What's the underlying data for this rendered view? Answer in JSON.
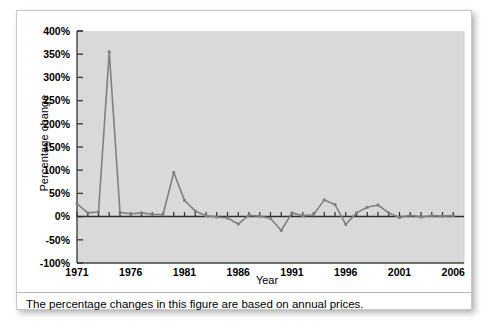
{
  "figure": {
    "caption": "The percentage changes in this figure are based on annual prices.",
    "background_color": "#ffffff",
    "plot_background_color": "#d9d9d9",
    "line_color": "#808080",
    "axis_color": "#404040"
  },
  "chart_data": {
    "type": "line",
    "title": "",
    "subtitle": "",
    "xlabel": "Year",
    "ylabel": "Percentage change",
    "xlim": [
      1971,
      2007
    ],
    "ylim": [
      -100,
      400
    ],
    "grid": false,
    "legend": "none",
    "y_ticks": [
      -100,
      -50,
      0,
      50,
      100,
      150,
      200,
      250,
      300,
      350,
      400
    ],
    "y_tick_labels": [
      "-100%",
      "-50%",
      "0%",
      "50%",
      "100%",
      "150%",
      "200%",
      "250%",
      "300%",
      "350%",
      "400%"
    ],
    "x_ticks": [
      1971,
      1972,
      1973,
      1974,
      1975,
      1976,
      1977,
      1978,
      1979,
      1980,
      1981,
      1982,
      1983,
      1984,
      1985,
      1986,
      1987,
      1988,
      1989,
      1990,
      1991,
      1992,
      1993,
      1994,
      1995,
      1996,
      1997,
      1998,
      1999,
      2000,
      2001,
      2002,
      2003,
      2004,
      2005,
      2006
    ],
    "x_tick_labels_shown": [
      "1971",
      "1976",
      "1981",
      "1986",
      "1991",
      "1996",
      "2001",
      "2006"
    ],
    "x_tick_labels_shown_values": [
      1971,
      1976,
      1981,
      1986,
      1991,
      1996,
      2001,
      2006
    ],
    "series": [
      {
        "name": "Percentage change",
        "x": [
          1971,
          1972,
          1973,
          1974,
          1975,
          1976,
          1977,
          1978,
          1979,
          1980,
          1981,
          1982,
          1983,
          1984,
          1985,
          1986,
          1987,
          1988,
          1989,
          1990,
          1991,
          1992,
          1993,
          1994,
          1995,
          1996,
          1997,
          1998,
          1999,
          2000,
          2001,
          2002,
          2003,
          2004,
          2005,
          2006
        ],
        "values": [
          28,
          8,
          10,
          355,
          9,
          6,
          8,
          5,
          4,
          95,
          35,
          12,
          2,
          -1,
          -3,
          -16,
          3,
          1,
          -4,
          -30,
          8,
          2,
          4,
          36,
          26,
          -17,
          8,
          20,
          25,
          8,
          -2,
          3,
          -1,
          2,
          1,
          2
        ]
      }
    ]
  }
}
